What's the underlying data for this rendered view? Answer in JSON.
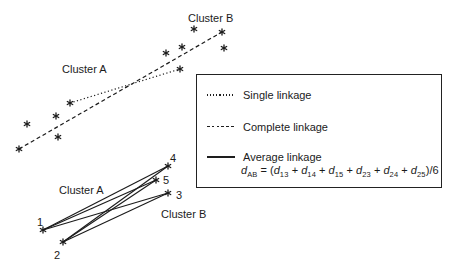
{
  "colors": {
    "ink": "#1b1b1b",
    "background": "#ffffff"
  },
  "diagram": {
    "upper": {
      "cluster_a_label": {
        "text": "Cluster A",
        "x": 62,
        "y": 73
      },
      "cluster_b_label": {
        "text": "Cluster B",
        "x": 188,
        "y": 22
      },
      "points_a": [
        [
          70,
          103
        ],
        [
          56,
          116
        ],
        [
          27,
          124
        ],
        [
          58,
          137
        ],
        [
          19,
          149
        ]
      ],
      "points_b": [
        [
          194,
          29
        ],
        [
          222,
          32
        ],
        [
          182,
          47
        ],
        [
          224,
          48
        ],
        [
          166,
          53
        ],
        [
          180,
          69
        ]
      ],
      "single_linkage_line": {
        "x1": 70,
        "y1": 103,
        "x2": 180,
        "y2": 69,
        "dash": "1.2 2.4"
      },
      "complete_linkage_line": {
        "x1": 19,
        "y1": 149,
        "x2": 222,
        "y2": 32,
        "dash": "4 2.8"
      }
    },
    "lower": {
      "cluster_a_label": {
        "text": "Cluster A",
        "x": 59,
        "y": 194
      },
      "cluster_b_label": {
        "text": "Cluster B",
        "x": 161,
        "y": 218
      },
      "points": {
        "1": [
          43,
          230
        ],
        "2": [
          63,
          242
        ],
        "3": [
          168,
          193
        ],
        "4": [
          168,
          166
        ],
        "5": [
          156,
          180
        ]
      },
      "point_labels": [
        {
          "text": "1",
          "x": 40,
          "y": 226
        },
        {
          "text": "2",
          "x": 57,
          "y": 259
        },
        {
          "text": "3",
          "x": 179,
          "y": 199
        },
        {
          "text": "4",
          "x": 173,
          "y": 162
        },
        {
          "text": "5",
          "x": 166,
          "y": 184
        }
      ],
      "average_linkage_pairs": [
        [
          "1",
          "3"
        ],
        [
          "1",
          "4"
        ],
        [
          "1",
          "5"
        ],
        [
          "2",
          "3"
        ],
        [
          "2",
          "4"
        ],
        [
          "2",
          "5"
        ]
      ]
    }
  },
  "legend": {
    "items": [
      {
        "label": "Single linkage",
        "line_style": "dotted"
      },
      {
        "label": "Complete linkage",
        "line_style": "dashed"
      },
      {
        "label": "Average linkage",
        "line_style": "solid"
      }
    ],
    "formula": [
      {
        "text": "d",
        "italic": true
      },
      {
        "text": "AB",
        "sub": true
      },
      {
        "text": " = ("
      },
      {
        "text": "d",
        "italic": true
      },
      {
        "text": "13",
        "sub": true
      },
      {
        "text": " + "
      },
      {
        "text": "d",
        "italic": true
      },
      {
        "text": "14",
        "sub": true
      },
      {
        "text": " + "
      },
      {
        "text": "d",
        "italic": true
      },
      {
        "text": "15",
        "sub": true
      },
      {
        "text": " + "
      },
      {
        "text": "d",
        "italic": true
      },
      {
        "text": "23",
        "sub": true
      },
      {
        "text": " + "
      },
      {
        "text": "d",
        "italic": true
      },
      {
        "text": "24",
        "sub": true
      },
      {
        "text": " + "
      },
      {
        "text": "d",
        "italic": true
      },
      {
        "text": "25",
        "sub": true
      },
      {
        "text": ")/6"
      }
    ]
  }
}
